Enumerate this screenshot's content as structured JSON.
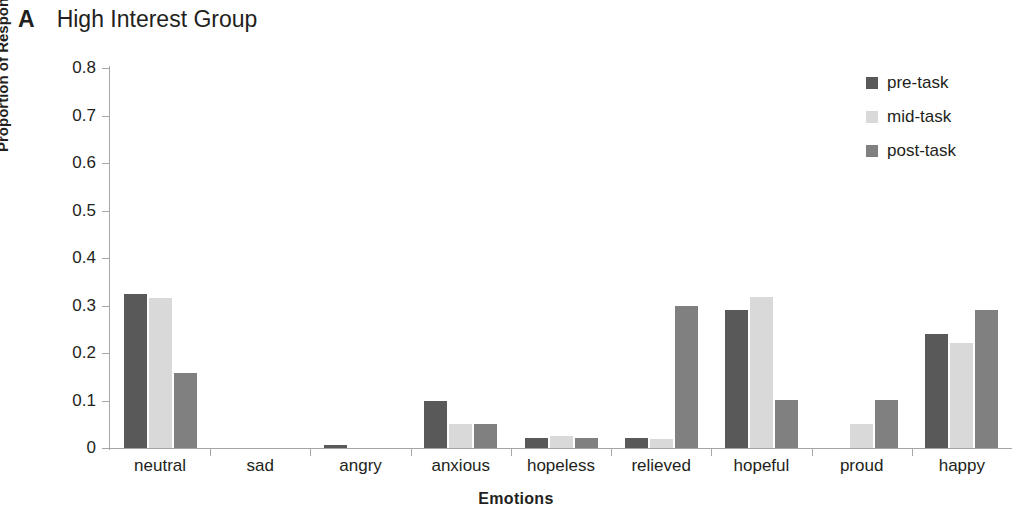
{
  "panel": {
    "letter": "A",
    "title": "High Interest Group"
  },
  "chart_data": {
    "type": "bar",
    "title": "High Interest Group",
    "xlabel": "Emotions",
    "ylabel": "Proportion of Respondents",
    "ylim": [
      0,
      0.8
    ],
    "ytick_labels": [
      "0.8",
      "0.7",
      "0.6",
      "0.5",
      "0.4",
      "0.3",
      "0.2",
      "0.1",
      "0"
    ],
    "ytick_values": [
      0.8,
      0.7,
      0.6,
      0.5,
      0.4,
      0.3,
      0.2,
      0.1,
      0
    ],
    "grid": false,
    "legend_position": "top-right",
    "categories": [
      "neutral",
      "sad",
      "angry",
      "anxious",
      "hopeless",
      "relieved",
      "hopeful",
      "proud",
      "happy"
    ],
    "series": [
      {
        "name": "pre-task",
        "color": "#595959",
        "values": [
          0.325,
          0,
          0.006,
          0.1,
          0.021,
          0.021,
          0.29,
          0,
          0.239
        ]
      },
      {
        "name": "mid-task",
        "color": "#d9d9d9",
        "values": [
          0.315,
          0,
          0,
          0.05,
          0.026,
          0.02,
          0.318,
          0.05,
          0.222
        ]
      },
      {
        "name": "post-task",
        "color": "#808080",
        "values": [
          0.158,
          0,
          0,
          0.05,
          0.021,
          0.298,
          0.102,
          0.102,
          0.291
        ]
      }
    ]
  },
  "legend": {
    "items": [
      {
        "label": "pre-task",
        "color": "#595959"
      },
      {
        "label": "mid-task",
        "color": "#d9d9d9"
      },
      {
        "label": "post-task",
        "color": "#808080"
      }
    ]
  }
}
